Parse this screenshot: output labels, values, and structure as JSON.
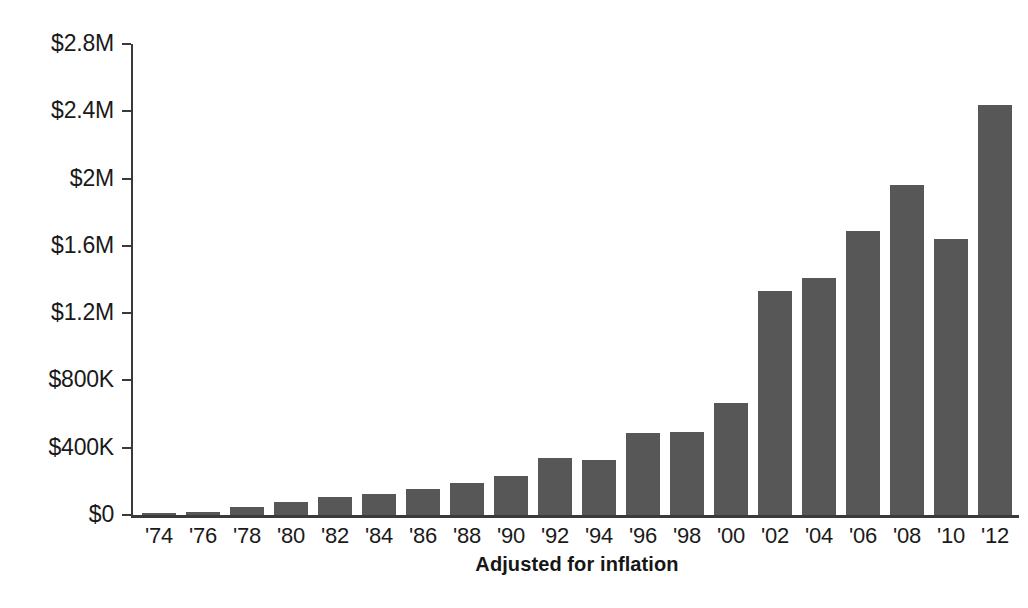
{
  "chart_data": {
    "type": "bar",
    "title": "",
    "subtitle": "",
    "xlabel": "Adjusted for inflation",
    "ylabel": "",
    "categories": [
      "'74",
      "'76",
      "'78",
      "'80",
      "'82",
      "'84",
      "'86",
      "'88",
      "'90",
      "'92",
      "'94",
      "'96",
      "'98",
      "'00",
      "'02",
      "'04",
      "'06",
      "'08",
      "'10",
      "'12"
    ],
    "values": [
      10000,
      15000,
      45000,
      75000,
      110000,
      125000,
      155000,
      190000,
      230000,
      340000,
      330000,
      490000,
      495000,
      665000,
      1330000,
      1410000,
      1690000,
      1960000,
      1640000,
      2440000
    ],
    "ylim": [
      0,
      2800000
    ],
    "y_tick_values": [
      0,
      400000,
      800000,
      1200000,
      1600000,
      2000000,
      2400000,
      2800000
    ],
    "y_tick_labels": [
      "$0",
      "$400K",
      "$800K",
      "$1.2M",
      "$1.6M",
      "$2M",
      "$2.4M",
      "$2.8M"
    ],
    "grid": false,
    "legend": null,
    "legend_position": "none",
    "bar_color": "#575757",
    "axis_color": "#3a3a3a",
    "background_color": "#ffffff",
    "annotations": []
  },
  "axis": {
    "x_title": "Adjusted for inflation"
  }
}
